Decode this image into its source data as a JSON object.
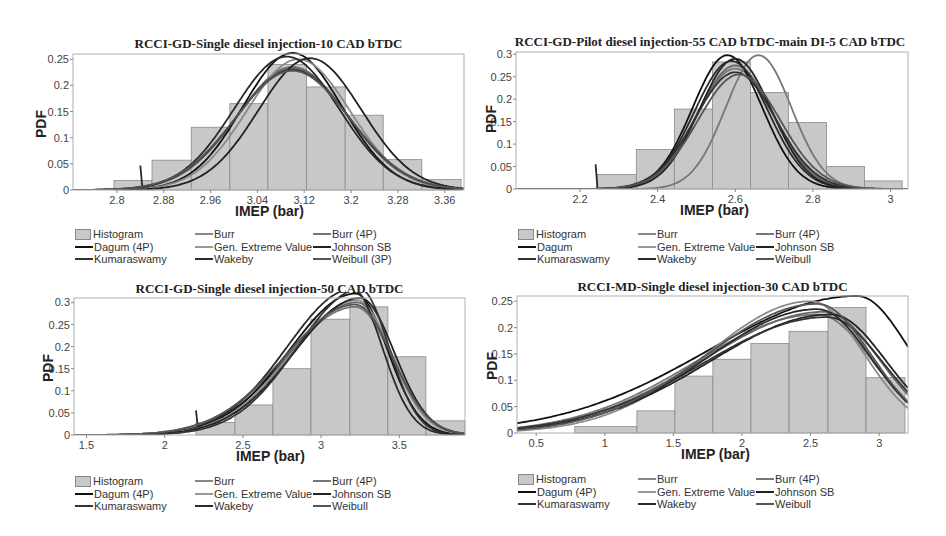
{
  "chart_data": [
    {
      "type": "bar",
      "title": "RCCI-GD-Single diesel injection-10 CAD bTDC",
      "xlabel": "IMEP (bar)",
      "ylabel": "PDF",
      "xlim": [
        2.725,
        3.393
      ],
      "ylim": [
        0,
        0.26
      ],
      "xticks": [
        "2.8",
        "2.88",
        "2.96",
        "3.04",
        "3.12",
        "3.2",
        "3.28",
        "3.36"
      ],
      "xtick_values": [
        2.8,
        2.88,
        2.96,
        3.04,
        3.12,
        3.2,
        3.28,
        3.36
      ],
      "yticks": [
        "0",
        "0.05",
        "0.1",
        "0.15",
        "0.2",
        "0.25"
      ],
      "ytick_values": [
        0,
        0.05,
        0.1,
        0.15,
        0.2,
        0.25
      ],
      "histogram": {
        "bin_edges": [
          2.795,
          2.86,
          2.927,
          2.993,
          3.058,
          3.124,
          3.19,
          3.255,
          3.321,
          3.388
        ],
        "values": [
          0.018,
          0.057,
          0.12,
          0.165,
          0.24,
          0.197,
          0.143,
          0.058,
          0.02
        ]
      },
      "curves": [
        {
          "name": "Burr",
          "peak_x": 3.1,
          "peak_y": 0.232,
          "spread": 0.095,
          "skew": 0,
          "color": "#777777"
        },
        {
          "name": "Burr (4P)",
          "peak_x": 3.1,
          "peak_y": 0.235,
          "spread": 0.094,
          "skew": 0,
          "color": "#666666"
        },
        {
          "name": "Dagum (4P)",
          "peak_x": 3.1,
          "peak_y": 0.262,
          "spread": 0.085,
          "skew": 0,
          "color": "#111111"
        },
        {
          "name": "Gen. Extreme Value",
          "peak_x": 3.11,
          "peak_y": 0.25,
          "spread": 0.088,
          "skew": 0,
          "color": "#8a8a8a"
        },
        {
          "name": "Johnson SB",
          "peak_x": 3.13,
          "peak_y": 0.252,
          "spread": 0.088,
          "skew": 0,
          "color": "#222222"
        },
        {
          "name": "Kumaraswamy",
          "peak_x": 3.1,
          "peak_y": 0.23,
          "spread": 0.096,
          "skew": 0,
          "color": "#333333"
        },
        {
          "name": "Wakeby",
          "peak_x": 3.09,
          "peak_y": 0.255,
          "spread": 0.09,
          "skew": 0,
          "color": "#2a2a2a",
          "start_x": 2.84
        },
        {
          "name": "Weibull (3P)",
          "peak_x": 3.1,
          "peak_y": 0.228,
          "spread": 0.097,
          "skew": 0,
          "color": "#555555"
        }
      ],
      "legend": [
        "Histogram",
        "Burr",
        "Burr (4P)",
        "Dagum (4P)",
        "Gen. Extreme Value",
        "Johnson SB",
        "Kumaraswamy",
        "Wakeby",
        "Weibull (3P)"
      ],
      "grid": false,
      "legend_position": "below"
    },
    {
      "type": "bar",
      "title": "RCCI-GD-Pilot diesel injection-55 CAD bTDC-main DI-5 CAD bTDC",
      "xlabel": "IMEP (bar)",
      "ylabel": "PDF",
      "xlim": [
        2.035,
        3.045
      ],
      "ylim": [
        0,
        0.305
      ],
      "xticks": [
        "2.2",
        "2.4",
        "2.6",
        "2.8",
        "3"
      ],
      "xtick_values": [
        2.2,
        2.4,
        2.6,
        2.8,
        3.0
      ],
      "yticks": [
        "0",
        "0.05",
        "0.1",
        "0.15",
        "0.2",
        "0.25",
        "0.3"
      ],
      "ytick_values": [
        0,
        0.05,
        0.1,
        0.15,
        0.2,
        0.25,
        0.3
      ],
      "histogram": {
        "bin_edges": [
          2.244,
          2.345,
          2.443,
          2.541,
          2.639,
          2.737,
          2.835,
          2.933,
          3.03
        ],
        "values": [
          0.032,
          0.088,
          0.178,
          0.283,
          0.215,
          0.148,
          0.05,
          0.018
        ]
      },
      "curves": [
        {
          "name": "Burr",
          "peak_x": 2.6,
          "peak_y": 0.268,
          "spread": 0.1,
          "skew": 0,
          "color": "#777777"
        },
        {
          "name": "Burr (4P)",
          "peak_x": 2.6,
          "peak_y": 0.275,
          "spread": 0.098,
          "skew": 0,
          "color": "#666666"
        },
        {
          "name": "Dagum",
          "peak_x": 2.58,
          "peak_y": 0.298,
          "spread": 0.09,
          "skew": 0,
          "color": "#111111"
        },
        {
          "name": "Gen. Extreme Value",
          "peak_x": 2.66,
          "peak_y": 0.298,
          "spread": 0.085,
          "skew": 0,
          "color": "#777777"
        },
        {
          "name": "Johnson SB",
          "peak_x": 2.6,
          "peak_y": 0.29,
          "spread": 0.093,
          "skew": 0,
          "color": "#222222"
        },
        {
          "name": "Kumaraswamy",
          "peak_x": 2.6,
          "peak_y": 0.26,
          "spread": 0.103,
          "skew": 0,
          "color": "#333333"
        },
        {
          "name": "Wakeby",
          "peak_x": 2.59,
          "peak_y": 0.285,
          "spread": 0.095,
          "skew": 0,
          "color": "#2a2a2a",
          "start_x": 2.24
        },
        {
          "name": "Weibull",
          "peak_x": 2.61,
          "peak_y": 0.255,
          "spread": 0.105,
          "skew": 0,
          "color": "#555555"
        }
      ],
      "legend": [
        "Histogram",
        "Burr",
        "Burr (4P)",
        "Dagum",
        "Gen. Extreme Value",
        "Johnson SB",
        "Kumaraswamy",
        "Wakeby",
        "Weibull"
      ],
      "grid": false,
      "legend_position": "below"
    },
    {
      "type": "bar",
      "title": "RCCI-GD-Single diesel injection-50 CAD bTDC",
      "xlabel": "IMEP (bar)",
      "ylabel": "PDF",
      "xlim": [
        1.42,
        3.92
      ],
      "ylim": [
        0,
        0.31
      ],
      "xticks": [
        "1.5",
        "2",
        "2.5",
        "3",
        "3.5"
      ],
      "xtick_values": [
        1.5,
        2.0,
        2.5,
        3.0,
        3.5
      ],
      "yticks": [
        "0",
        "0.05",
        "0.1",
        "0.15",
        "0.2",
        "0.25",
        "0.3"
      ],
      "ytick_values": [
        0,
        0.05,
        0.1,
        0.15,
        0.2,
        0.25,
        0.3
      ],
      "histogram": {
        "bin_edges": [
          2.2,
          2.449,
          2.692,
          2.935,
          3.184,
          3.427,
          3.67,
          3.919
        ],
        "values": [
          0.028,
          0.068,
          0.15,
          0.262,
          0.29,
          0.177,
          0.032
        ]
      },
      "curves": [
        {
          "name": "Burr",
          "peak_x": 3.22,
          "peak_y": 0.29,
          "spread": 0.3,
          "skew": 0.5,
          "color": "#777777"
        },
        {
          "name": "Burr (4P)",
          "peak_x": 3.23,
          "peak_y": 0.3,
          "spread": 0.29,
          "skew": 0.5,
          "color": "#666666"
        },
        {
          "name": "Dagum (4P)",
          "peak_x": 3.22,
          "peak_y": 0.32,
          "spread": 0.27,
          "skew": 0.55,
          "color": "#111111"
        },
        {
          "name": "Gen. Extreme Value",
          "peak_x": 3.23,
          "peak_y": 0.305,
          "spread": 0.28,
          "skew": 0.5,
          "color": "#8a8a8a"
        },
        {
          "name": "Johnson SB",
          "peak_x": 3.25,
          "peak_y": 0.31,
          "spread": 0.28,
          "skew": 0.5,
          "color": "#222222"
        },
        {
          "name": "Kumaraswamy",
          "peak_x": 3.25,
          "peak_y": 0.33,
          "spread": 0.25,
          "skew": 0.6,
          "color": "#333333"
        },
        {
          "name": "Wakeby",
          "peak_x": 3.2,
          "peak_y": 0.33,
          "spread": 0.26,
          "skew": 0.6,
          "color": "#2a2a2a",
          "start_x": 2.2
        },
        {
          "name": "Weibull",
          "peak_x": 3.22,
          "peak_y": 0.295,
          "spread": 0.3,
          "skew": 0.5,
          "color": "#555555"
        }
      ],
      "legend": [
        "Histogram",
        "Burr",
        "Burr (4P)",
        "Dagum (4P)",
        "Gen. Extreme Value",
        "Johnson SB",
        "Kumaraswamy",
        "Wakeby",
        "Weibull"
      ],
      "grid": false,
      "legend_position": "below"
    },
    {
      "type": "bar",
      "title": "RCCI-MD-Single diesel injection-30 CAD bTDC",
      "xlabel": "IMEP (bar)",
      "ylabel": "PDF",
      "xlim": [
        0.36,
        3.21
      ],
      "ylim": [
        0,
        0.26
      ],
      "xticks": [
        "0.5",
        "1",
        "1.5",
        "2",
        "2.5",
        "3"
      ],
      "xtick_values": [
        0.5,
        1.0,
        1.5,
        2.0,
        2.5,
        3.0
      ],
      "yticks": [
        "0",
        "0.05",
        "0.1",
        "0.15",
        "0.2",
        "0.25"
      ],
      "ytick_values": [
        0,
        0.05,
        0.1,
        0.15,
        0.2,
        0.25
      ],
      "histogram": {
        "bin_edges": [
          0.781,
          1.234,
          1.511,
          1.788,
          2.065,
          2.343,
          2.627,
          2.904,
          3.188
        ],
        "values": [
          0.012,
          0.042,
          0.108,
          0.14,
          0.17,
          0.193,
          0.238,
          0.105
        ]
      },
      "curves": [
        {
          "name": "Burr",
          "peak_x": 2.55,
          "peak_y": 0.225,
          "spread": 0.55,
          "skew": 0.6,
          "color": "#777777"
        },
        {
          "name": "Burr (4P)",
          "peak_x": 2.6,
          "peak_y": 0.23,
          "spread": 0.55,
          "skew": 0.6,
          "color": "#666666"
        },
        {
          "name": "Dagum (4P)",
          "peak_x": 2.84,
          "peak_y": 0.26,
          "spread": 0.6,
          "skew": 0.8,
          "color": "#111111"
        },
        {
          "name": "Gen. Extreme Value",
          "peak_x": 2.5,
          "peak_y": 0.25,
          "spread": 0.5,
          "skew": 0.5,
          "color": "#8a8a8a"
        },
        {
          "name": "Johnson SB",
          "peak_x": 2.65,
          "peak_y": 0.225,
          "spread": 0.55,
          "skew": 0.6,
          "color": "#222222"
        },
        {
          "name": "Kumaraswamy",
          "peak_x": 2.62,
          "peak_y": 0.22,
          "spread": 0.56,
          "skew": 0.6,
          "color": "#333333"
        },
        {
          "name": "Wakeby",
          "peak_x": 2.55,
          "peak_y": 0.235,
          "spread": 0.52,
          "skew": 0.55,
          "color": "#2a2a2a",
          "start_x": 1.1
        },
        {
          "name": "Weibull",
          "peak_x": 2.55,
          "peak_y": 0.245,
          "spread": 0.52,
          "skew": 0.55,
          "color": "#555555"
        }
      ],
      "legend": [
        "Histogram",
        "Burr",
        "Burr (4P)",
        "Dagum (4P)",
        "Gen. Extreme Value",
        "Johnson SB",
        "Kumaraswamy",
        "Wakeby",
        "Weibull"
      ],
      "grid": false,
      "legend_position": "below"
    }
  ],
  "panels": [
    {
      "title": "RCCI-GD-Single diesel injection-10 CAD bTDC",
      "xlabel": "IMEP (bar)",
      "ylabel": "PDF",
      "legend": [
        "Histogram",
        "Burr",
        "Burr (4P)",
        "Dagum (4P)",
        "Gen. Extreme Value",
        "Johnson SB",
        "Kumaraswamy",
        "Wakeby",
        "Weibull (3P)"
      ]
    },
    {
      "title": "RCCI-GD-Pilot diesel injection-55 CAD bTDC-main DI-5 CAD bTDC",
      "xlabel": "IMEP (bar)",
      "ylabel": "PDF",
      "legend": [
        "Histogram",
        "Burr",
        "Burr (4P)",
        "Dagum",
        "Gen. Extreme Value",
        "Johnson SB",
        "Kumaraswamy",
        "Wakeby",
        "Weibull"
      ]
    },
    {
      "title": "RCCI-GD-Single diesel injection-50 CAD bTDC",
      "xlabel": "IMEP (bar)",
      "ylabel": "PDF",
      "legend": [
        "Histogram",
        "Burr",
        "Burr (4P)",
        "Dagum (4P)",
        "Gen. Extreme Value",
        "Johnson SB",
        "Kumaraswamy",
        "Wakeby",
        "Weibull"
      ]
    },
    {
      "title": "RCCI-MD-Single diesel injection-30 CAD bTDC",
      "xlabel": "IMEP (bar)",
      "ylabel": "PDF",
      "legend": [
        "Histogram",
        "Burr",
        "Burr (4P)",
        "Dagum (4P)",
        "Gen. Extreme Value",
        "Johnson SB",
        "Kumaraswamy",
        "Wakeby",
        "Weibull"
      ]
    }
  ],
  "colors": {
    "histogram_fill": "#c8c8c8",
    "histogram_edge": "#8a8a8a",
    "frame": "#b0b0b0"
  }
}
